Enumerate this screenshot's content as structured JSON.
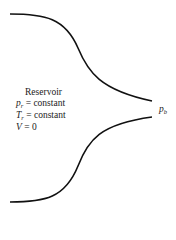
{
  "diagram": {
    "title": "Reservoir",
    "conditions": [
      {
        "symbol": "p",
        "subscript": "r",
        "relation": "= constant"
      },
      {
        "symbol": "T",
        "subscript": "r",
        "relation": "= constant"
      },
      {
        "symbol": "V",
        "subscript": "",
        "relation": "= 0"
      }
    ],
    "exit_label": {
      "symbol": "p",
      "subscript": "b"
    },
    "line_color": "#111111"
  }
}
